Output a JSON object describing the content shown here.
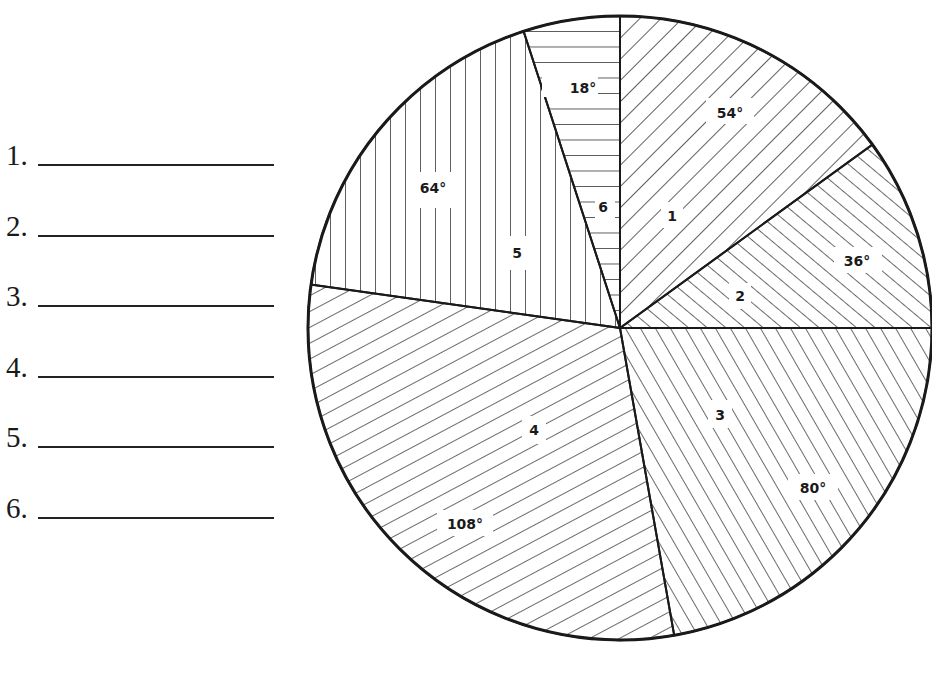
{
  "worksheet": {
    "blanks": [
      {
        "number": "1.",
        "value": ""
      },
      {
        "number": "2.",
        "value": ""
      },
      {
        "number": "3.",
        "value": ""
      },
      {
        "number": "4.",
        "value": ""
      },
      {
        "number": "5.",
        "value": ""
      },
      {
        "number": "6.",
        "value": ""
      }
    ]
  },
  "chart_data": {
    "type": "pie",
    "title": "",
    "unit": "degrees",
    "categories": [
      "1",
      "2",
      "3",
      "4",
      "5",
      "6"
    ],
    "values": [
      54,
      36,
      80,
      108,
      64,
      18
    ],
    "labels": [
      "54°",
      "36°",
      "80°",
      "108°",
      "64°",
      "18°"
    ],
    "fills": [
      "diagonal-hatch-down",
      "diagonal-hatch-up-dense",
      "diagonal-hatch-up-steep",
      "diagonal-hatch-up-shallow",
      "vertical-lines",
      "horizontal-lines"
    ],
    "start_angle": 0,
    "direction": "clockwise",
    "total": 360
  },
  "colors": {
    "ink": "#1a1a1a",
    "paper": "#ffffff"
  }
}
